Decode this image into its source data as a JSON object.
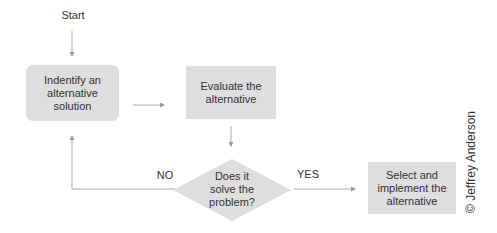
{
  "diagram": {
    "type": "flowchart",
    "start_label": "Start",
    "nodes": [
      {
        "id": "identify",
        "shape": "rounded-rectangle",
        "label": "Indentify an alternative solution"
      },
      {
        "id": "evaluate",
        "shape": "rectangle",
        "label": "Evaluate the alternative"
      },
      {
        "id": "decision",
        "shape": "diamond",
        "label": "Does it solve the problem?"
      },
      {
        "id": "select",
        "shape": "rectangle",
        "label": "Select and implement the alternative"
      }
    ],
    "edges": [
      {
        "from": "start",
        "to": "identify",
        "label": ""
      },
      {
        "from": "identify",
        "to": "evaluate",
        "label": ""
      },
      {
        "from": "evaluate",
        "to": "decision",
        "label": ""
      },
      {
        "from": "decision",
        "to": "identify",
        "label": "NO"
      },
      {
        "from": "decision",
        "to": "select",
        "label": "YES"
      }
    ],
    "no_label": "NO",
    "yes_label": "YES",
    "copyright": "© Jeffrey Anderson",
    "colors": {
      "node_fill": "#dedede",
      "line": "#999999",
      "text": "#333333"
    }
  }
}
